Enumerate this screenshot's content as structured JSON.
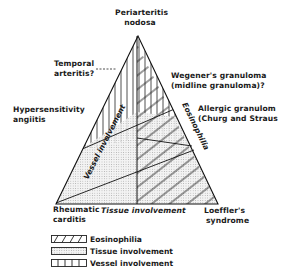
{
  "diagram": {
    "vertices": {
      "top": "Periarteritis nodosa",
      "bottom_left": "Rheumatic carditis",
      "bottom_right": "Loeffler's syndrome"
    },
    "axes": {
      "left": "Vessel involvement",
      "right": "Eosinophilia",
      "bottom": "Tissue involvement"
    },
    "labels": {
      "periarteritis_1": "Periarteritis",
      "periarteritis_2": "nodosa",
      "temporal_1": "Temporal",
      "temporal_2": "arteritis?",
      "hypersens_1": "Hypersensitivity",
      "hypersens_2": "angiitis",
      "wegener_1": "Wegener's granuloma",
      "wegener_2": "(midline granuloma)?",
      "allergic_1": "Allergic granulom",
      "allergic_2": "(Churg and Straus",
      "rheumatic_1": "Rheumatic",
      "rheumatic_2": "carditis",
      "loeffler_1": "Loeffler's",
      "loeffler_2": "syndrome",
      "vessel_axis": "Vessel involvement",
      "eosin_axis": "Eosinophilia",
      "tissue_axis": "Tissue involvement"
    },
    "legend": [
      {
        "pattern": "diagonal-hatch",
        "label": "Eosinophilia"
      },
      {
        "pattern": "dotted-shade",
        "label": "Tissue involvement"
      },
      {
        "pattern": "vertical-lines",
        "label": "Vessel involvement"
      }
    ]
  }
}
